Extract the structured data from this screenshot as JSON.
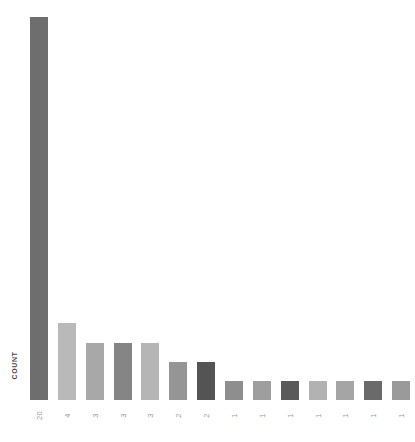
{
  "chart_data": {
    "type": "bar",
    "title": "",
    "xlabel": "",
    "ylabel": "COUNT",
    "categories": [
      "20",
      "4",
      "3",
      "3",
      "3",
      "2",
      "2",
      "1",
      "1",
      "1",
      "1",
      "1",
      "1",
      "1"
    ],
    "values": [
      20,
      4,
      3,
      3,
      3,
      2,
      2,
      1,
      1,
      1,
      1,
      1,
      1,
      1
    ],
    "ylim": [
      0,
      20
    ],
    "grid": false,
    "legend": null,
    "bar_colors": [
      "#6e6e6e",
      "#b9b9b9",
      "#a8a8a8",
      "#858585",
      "#b5b5b5",
      "#959595",
      "#545454",
      "#8e8e8e",
      "#9e9e9e",
      "#5a5a5a",
      "#b2b2b2",
      "#a5a5a5",
      "#6a6a6a",
      "#9a9a9a"
    ],
    "tick_label_color": "#9a9a9a",
    "axis_label_color": "#4a4a4a",
    "background": "#ffffff"
  }
}
